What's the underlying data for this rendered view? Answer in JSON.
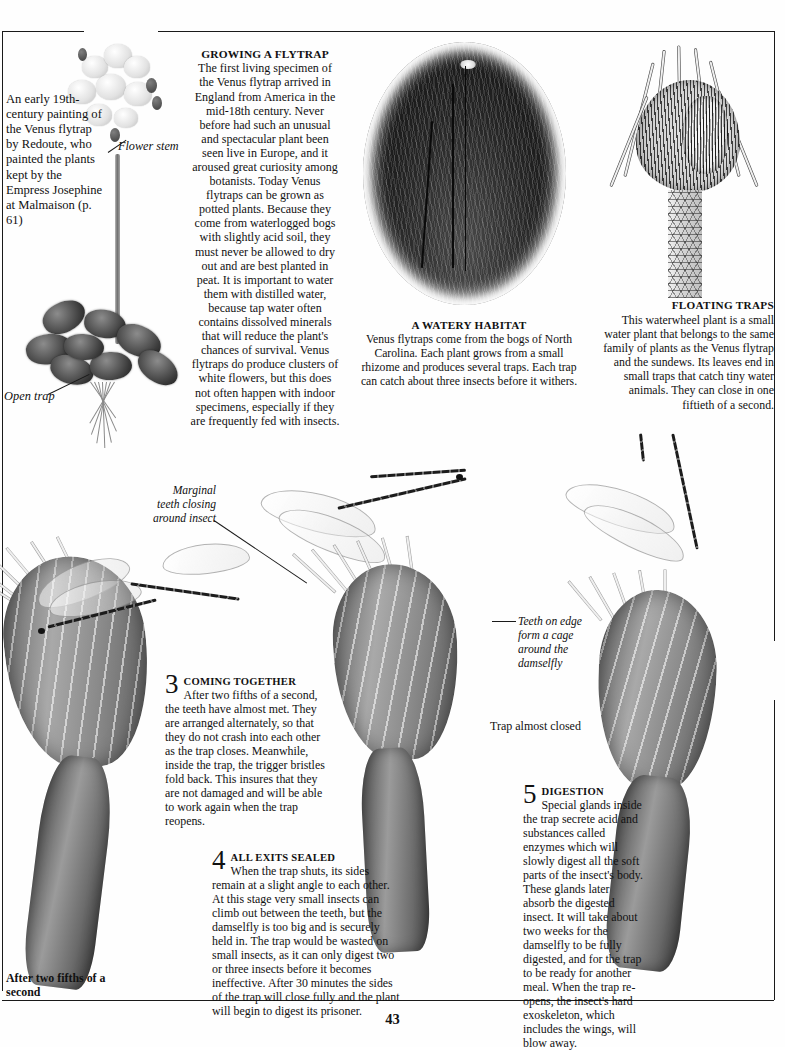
{
  "page": {
    "number": "43"
  },
  "redoute_caption": {
    "text": "An early 19th-century painting of the Venus flytrap by Redoute, who painted the plants kept by the Empress Josephine at Malmaison (p. 61)"
  },
  "labels": {
    "flower_stem": "Flower stem",
    "open_trap": "Open trap",
    "marginal_teeth": "Marginal teeth closing around insect",
    "teeth_edge": "Teeth on edge form a cage around the damselfly",
    "trap_almost_closed": "Trap almost closed",
    "after_two_fifths": "After two fifths of a second"
  },
  "growing": {
    "heading": "GROWING A FLYTRAP",
    "body": "The first living specimen of the Venus flytrap arrived in England from America in the mid-18th century. Never before had such an unusual and spectacular plant been seen live in Europe, and it aroused great curiosity among botanists. Today Venus flytraps can be grown as potted plants. Because they come from waterlogged bogs with slightly acid soil, they must never be allowed to dry out and are best planted in peat. It is important to water them with distilled water, because tap water often contains dissolved minerals that will reduce the plant's chances of survival. Venus flytraps do produce clusters of white flowers, but this does not often happen with indoor specimens, especially if they are frequently fed with insects."
  },
  "watery_habitat": {
    "heading": "A WATERY  HABITAT",
    "body": "Venus flytraps come from the bogs of North Carolina. Each plant grows from a small rhizome and produces several traps. Each trap can catch about three insects before it withers."
  },
  "floating_traps": {
    "heading": "FLOATING TRAPS",
    "body": "This waterwheel plant is a small water plant that belongs to the same family of plants as the Venus flytrap and the sundews. Its leaves end in small traps that catch tiny water animals. They can close in one fiftieth of a second."
  },
  "steps": [
    {
      "number": "3",
      "heading": "COMING TOGETHER",
      "body": "After two fifths of a second, the teeth have almost met. They are arranged alternately, so that they do not crash into each other as the trap closes. Meanwhile, inside the trap, the trigger bristles fold back. This insures that they are not damaged and will be able to work again when the trap reopens."
    },
    {
      "number": "4",
      "heading": "ALL EXITS SEALED",
      "body": "When the trap shuts, its sides remain at a slight angle to each other. At this stage very small insects can climb out between the teeth, but the damselfly is too big and is securely held in. The trap would be wasted on small insects, as it can only digest two or three insects before it becomes ineffective. After 30 minutes the sides of the trap will close fully and the plant will begin to digest its prisoner."
    },
    {
      "number": "5",
      "heading": "DIGESTION",
      "body": "Special glands inside the trap secrete acid and substances called enzymes which will slowly digest all the soft parts of the insect's body. These glands later absorb the digested insect. It will take about two weeks for the damselfly to be fully digested, and for the trap to be ready for another meal. When the trap re-opens, the insect's hard exoskeleton, which includes the wings, will blow away."
    }
  ],
  "colors": {
    "ink": "#111111",
    "rule": "#1a1a1a",
    "paper": "#fefefe"
  }
}
